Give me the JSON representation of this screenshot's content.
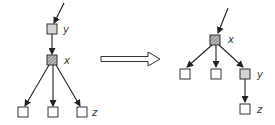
{
  "diagram": {
    "colors": {
      "stroke": "#222222",
      "gray_fill": "#d4d4d4",
      "hatch_fill": "#9a9a9a",
      "white_fill": "#ffffff"
    },
    "left_tree": {
      "labels": {
        "y": "y",
        "x": "x",
        "z": "z"
      },
      "nodes": [
        {
          "id": "y",
          "label": "y",
          "fill": "gray"
        },
        {
          "id": "x",
          "label": "x",
          "fill": "hatched"
        },
        {
          "id": "leaf1",
          "label": "",
          "fill": "white"
        },
        {
          "id": "leaf2",
          "label": "",
          "fill": "white"
        },
        {
          "id": "z",
          "label": "z",
          "fill": "white"
        }
      ],
      "edges": [
        [
          "in",
          "y"
        ],
        [
          "y",
          "x"
        ],
        [
          "x",
          "leaf1"
        ],
        [
          "x",
          "leaf2"
        ],
        [
          "x",
          "z"
        ]
      ]
    },
    "transform_arrow": "right-arrow",
    "right_tree": {
      "labels": {
        "x": "x",
        "y": "y",
        "z": "z"
      },
      "nodes": [
        {
          "id": "x",
          "label": "x",
          "fill": "hatched"
        },
        {
          "id": "leaf1",
          "label": "",
          "fill": "white"
        },
        {
          "id": "leaf2",
          "label": "",
          "fill": "white"
        },
        {
          "id": "y",
          "label": "y",
          "fill": "gray"
        },
        {
          "id": "z",
          "label": "z",
          "fill": "white"
        }
      ],
      "edges": [
        [
          "in",
          "x"
        ],
        [
          "x",
          "leaf1"
        ],
        [
          "x",
          "leaf2"
        ],
        [
          "x",
          "y"
        ],
        [
          "y",
          "z"
        ]
      ]
    }
  }
}
